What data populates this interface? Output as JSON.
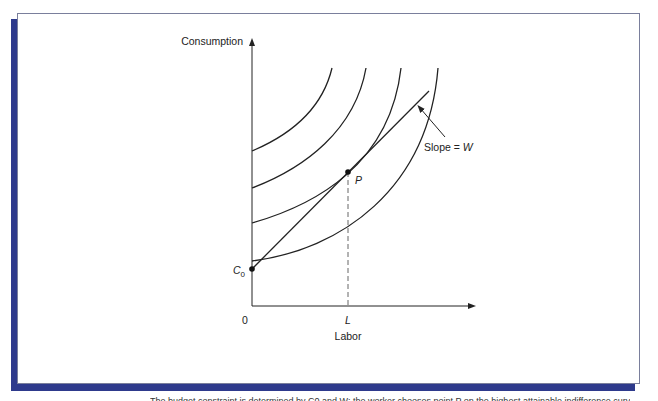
{
  "figure": {
    "y_axis_label": "Consumption",
    "x_axis_label": "Labor",
    "origin_label": "0",
    "x_tick_label": "L",
    "point_label": "P",
    "intercept_label": "C",
    "intercept_subscript": "0",
    "slope_label_prefix": "Slope = ",
    "slope_label_var": "W",
    "curves": [
      {
        "name": "indifference-curve-1",
        "intercept_y": 151
      },
      {
        "name": "indifference-curve-2",
        "intercept_y": 188
      },
      {
        "name": "indifference-curve-3",
        "intercept_y": 223
      },
      {
        "name": "indifference-curve-4",
        "intercept_y": 261
      }
    ],
    "colors": {
      "frame_shadow": "#2e3a8c",
      "frame_border": "#7a7f9c",
      "line": "#222222"
    }
  },
  "caption": {
    "text": "The budget constraint is determined by C0 and W; the worker chooses point P on the highest attainable indifference curve."
  }
}
